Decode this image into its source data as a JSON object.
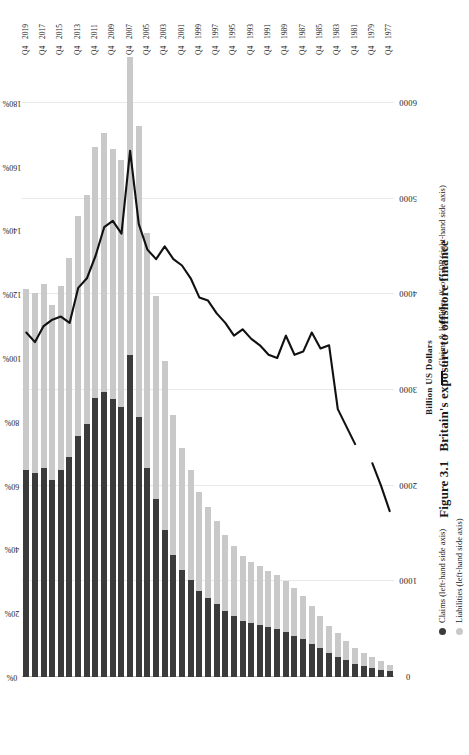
{
  "figure": {
    "number": "Figure 3.1",
    "caption": "Britain's exposure to offshore finance"
  },
  "legend": {
    "claims": "Claims (left-hand side axis)",
    "liabilities": "Liabilities (left-hand side axis)",
    "ratio": "Claims & liabilities, % of GDP (right-hand side axis)"
  },
  "colors": {
    "claims": "#3b3b3b",
    "liabilities": "#c9c9c9",
    "line": "#111111",
    "grid": "#e9e9e9"
  },
  "chart_data": {
    "type": "bar",
    "title": "Britain's exposure to offshore finance",
    "orientation": "horizontal-rotated",
    "stacked": true,
    "xlabel": "Billion US Dollars",
    "ylabel": "",
    "secondary_axis_label": "Claims & liabilities, % of GDP",
    "xlim": [
      0,
      6500
    ],
    "xticks": [
      0,
      1000,
      2000,
      3000,
      4000,
      5000,
      6000
    ],
    "xticklabels": [
      "0",
      "1000",
      "2000",
      "3000",
      "4000",
      "5000",
      "6000"
    ],
    "secondary_ticks": [
      0,
      20,
      40,
      60,
      80,
      100,
      120,
      140,
      160,
      180
    ],
    "secondary_ticklabels": [
      "0%",
      "20%",
      "40%",
      "60%",
      "80%",
      "100%",
      "120%",
      "140%",
      "160%",
      "180%"
    ],
    "secondary_lim": [
      0,
      195
    ],
    "grid": true,
    "legend_position": "bottom",
    "categories": [
      "Q4 1977",
      "Q4 1978",
      "Q4 1979",
      "Q4 1980",
      "Q4 1981",
      "Q4 1982",
      "Q4 1983",
      "Q4 1984",
      "Q4 1985",
      "Q4 1986",
      "Q4 1987",
      "Q4 1988",
      "Q4 1989",
      "Q4 1990",
      "Q4 1991",
      "Q4 1992",
      "Q4 1993",
      "Q4 1994",
      "Q4 1995",
      "Q4 1996",
      "Q4 1997",
      "Q4 1998",
      "Q4 1999",
      "Q4 2000",
      "Q4 2001",
      "Q4 2002",
      "Q4 2003",
      "Q4 2004",
      "Q4 2005",
      "Q4 2006",
      "Q4 2007",
      "Q4 2008",
      "Q4 2009",
      "Q4 2010",
      "Q4 2011",
      "Q4 2012",
      "Q4 2013",
      "Q4 2014",
      "Q4 2015",
      "Q4 2016",
      "Q4 2017",
      "Q4 2018",
      "Q4 2019"
    ],
    "tick_categories": [
      "Q4 1977",
      "Q4 1979",
      "Q4 1981",
      "Q4 1983",
      "Q4 1985",
      "Q4 1987",
      "Q4 1989",
      "Q4 1991",
      "Q4 1993",
      "Q4 1995",
      "Q4 1997",
      "Q4 1999",
      "Q4 2001",
      "Q4 2003",
      "Q4 2005",
      "Q4 2007",
      "Q4 2009",
      "Q4 2011",
      "Q4 2013",
      "Q4 2015",
      "Q4 2017",
      "Q4 2019"
    ],
    "series": [
      {
        "name": "Claims (left-hand side axis)",
        "axis": "left",
        "unit": "Billion US Dollars",
        "values": [
          60,
          75,
          95,
          115,
          140,
          175,
          210,
          250,
          300,
          345,
          395,
          430,
          470,
          500,
          520,
          540,
          560,
          590,
          640,
          690,
          760,
          830,
          900,
          1010,
          1120,
          1280,
          1540,
          1860,
          2180,
          2720,
          3360,
          2820,
          2900,
          2980,
          2920,
          2640,
          2520,
          2300,
          2160,
          2060,
          2180,
          2130,
          2160
        ]
      },
      {
        "name": "Liabilities (left-hand side axis)",
        "axis": "left",
        "unit": "Billion US Dollars",
        "values": [
          70,
          88,
          110,
          135,
          165,
          205,
          245,
          285,
          340,
          395,
          450,
          495,
          535,
          570,
          590,
          615,
          640,
          675,
          730,
          790,
          870,
          950,
          1030,
          1150,
          1270,
          1460,
          1760,
          2120,
          2460,
          3040,
          3120,
          2580,
          2620,
          2700,
          2620,
          2400,
          2300,
          2080,
          1930,
          1830,
          1930,
          1880,
          1890
        ]
      },
      {
        "name": "Claims & liabilities, % of GDP (right-hand side axis)",
        "axis": "right",
        "unit": "% of GDP",
        "values": [
          52,
          60,
          67,
          null,
          73,
          null,
          84,
          104,
          103,
          108,
          102,
          101,
          107,
          100,
          101,
          104,
          106,
          109,
          107,
          111,
          114,
          118,
          119,
          125,
          129,
          131,
          135,
          131,
          134,
          142,
          165,
          139,
          143,
          141,
          132,
          125,
          122,
          111,
          113,
          112,
          110,
          105,
          108
        ]
      }
    ]
  }
}
